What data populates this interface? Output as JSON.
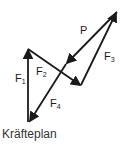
{
  "diagram": {
    "caption": "Kräfteplan",
    "labels": {
      "P": "P",
      "F1": {
        "base": "F",
        "sub": "1"
      },
      "F2": {
        "base": "F",
        "sub": "2"
      },
      "F3": {
        "base": "F",
        "sub": "3"
      },
      "F4": {
        "base": "F",
        "sub": "4"
      }
    },
    "stroke_color": "#1a1a1a"
  }
}
